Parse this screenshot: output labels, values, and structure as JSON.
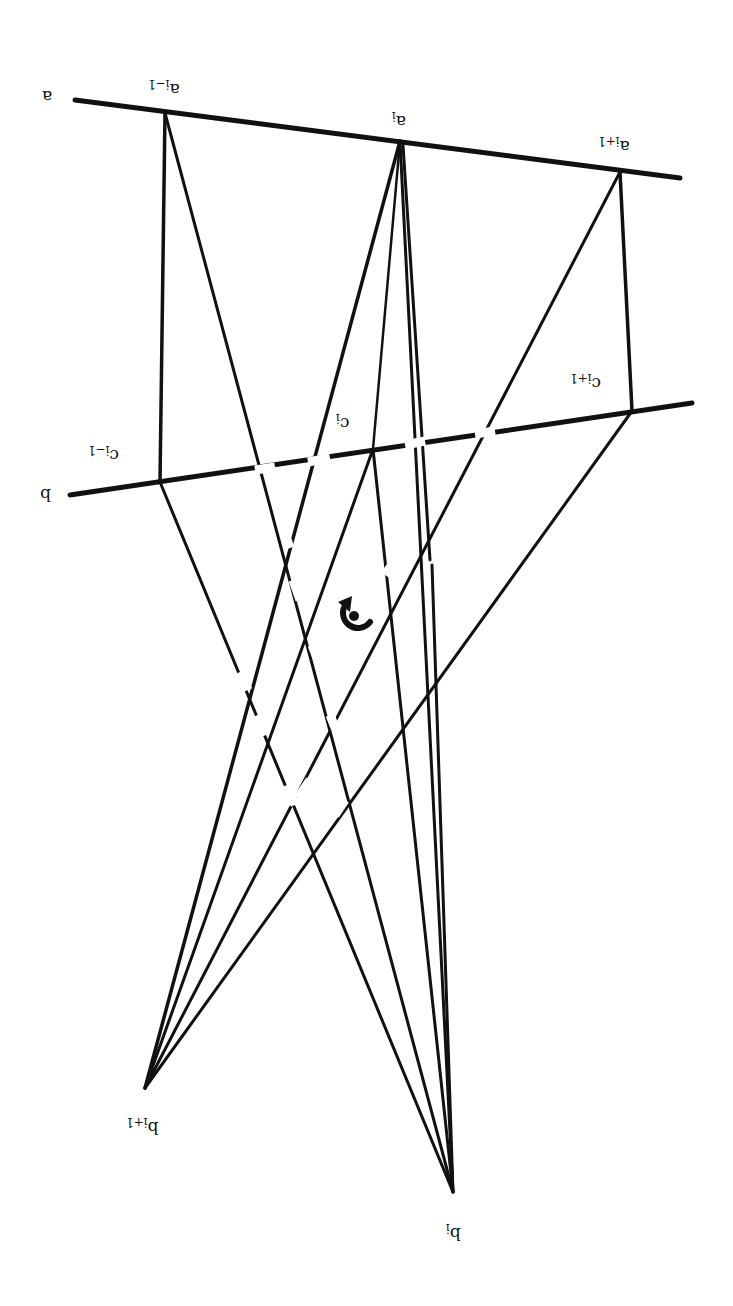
{
  "labels": {
    "a": "a",
    "b": "b",
    "a_prev": "a",
    "a_prev_sub": "i−1",
    "a_cur": "a",
    "a_cur_sub": "i",
    "a_next": "a",
    "a_next_sub": "i+1",
    "c_prev": "c",
    "c_prev_sub": "i−1",
    "c_cur": "c",
    "c_cur_sub": "i",
    "c_next": "c",
    "c_next_sub": "i+1",
    "b_cur": "b",
    "b_cur_sub": "i",
    "b_next": "b",
    "b_next_sub": "i+1"
  },
  "orientation_note": "rotated 180 degrees",
  "colors": {
    "ink": "#111111",
    "paper": "#ffffff"
  }
}
